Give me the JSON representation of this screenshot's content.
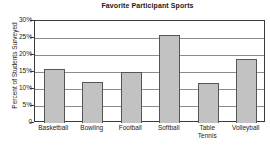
{
  "chart_data": {
    "type": "bar",
    "title": "Favorite Participant Sports",
    "xlabel": "",
    "ylabel": "Percent of Students Surveyed",
    "categories": [
      "Basketball",
      "Bowling",
      "Football",
      "Softball",
      "Table Tennis",
      "Volleyball"
    ],
    "category_lines": [
      [
        "Basketball"
      ],
      [
        "Bowling"
      ],
      [
        "Football"
      ],
      [
        "Softball"
      ],
      [
        "Table",
        "Tennis"
      ],
      [
        "Volleyball"
      ]
    ],
    "values": [
      16,
      12,
      15,
      26,
      11.8,
      18.8
    ],
    "ylim": [
      0,
      30
    ],
    "ytick_values": [
      0,
      5,
      10,
      15,
      20,
      25,
      30
    ],
    "ytick_labels": [
      "0",
      "5%",
      "10%",
      "15%",
      "20%",
      "25%",
      "30%"
    ],
    "grid": "horizontal",
    "legend": "none",
    "bar_fill_color": "#c2c2c2",
    "bar_border_color": "#565656",
    "gridline_color": "#8c8c8c",
    "axis_color": "#3a3a3a",
    "text_color": "#1a1a1a"
  }
}
